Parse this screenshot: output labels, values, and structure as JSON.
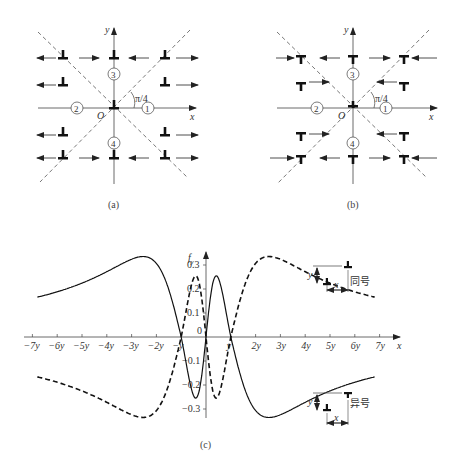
{
  "panels": {
    "a": {
      "caption": "(a)",
      "axis_x": "x",
      "axis_y": "y",
      "origin": "O",
      "angle": "π/4",
      "regions": [
        "①",
        "②",
        "③",
        "④"
      ],
      "dislocation_symbol": "⊥",
      "arrows": "outward (pointing away from y-axis, left and right)"
    },
    "b": {
      "caption": "(b)",
      "axis_x": "x",
      "axis_y": "y",
      "origin": "O",
      "angle": "π/4",
      "regions": [
        "①",
        "②",
        "③",
        "④"
      ],
      "dislocation_symbol": "T",
      "arrows": "inward (pointing toward dislocations)"
    },
    "c": {
      "caption": "(c)",
      "y_label": "f",
      "y_label_sub": "y",
      "x_label": "x",
      "legend_same": "同号",
      "legend_opposite": "异号",
      "legend_y": "y",
      "legend_x": "x"
    }
  },
  "chart_data": {
    "type": "line",
    "title": "",
    "xlabel": "x",
    "ylabel": "f_y",
    "x_ticks": [
      "-7y",
      "-6y",
      "-5y",
      "-4y",
      "-3y",
      "-2y",
      "-y",
      "y",
      "2y",
      "3y",
      "4y",
      "5y",
      "6y",
      "7y"
    ],
    "y_ticks": [
      "-0.3",
      "-0.2",
      "-0.1",
      "0",
      "0.1",
      "0.2",
      "0.3"
    ],
    "xlim": [
      -7,
      7
    ],
    "ylim": [
      -0.35,
      0.35
    ],
    "grid": false,
    "series": [
      {
        "name": "同号 (same sign)",
        "style": "solid",
        "x": [
          -6.8,
          -5,
          -3.5,
          -2.5,
          -1.5,
          -1,
          -0.5,
          0,
          0.5,
          1,
          1.5,
          2,
          3,
          4,
          5,
          6,
          6.8
        ],
        "values": [
          -0.13,
          -0.17,
          -0.23,
          -0.26,
          -0.2,
          0,
          0.25,
          0,
          -0.25,
          0,
          0.15,
          0.24,
          0.26,
          0.21,
          0.17,
          0.14,
          0.12
        ]
      },
      {
        "name": "异号 (opposite sign)",
        "style": "dashed",
        "x": [
          -6.8,
          -6,
          -5,
          -4,
          -3,
          -2.5,
          -1.5,
          -1,
          -0.5,
          0,
          0.5,
          1,
          1.5,
          2,
          3,
          4,
          5,
          6,
          6.8
        ],
        "values": [
          0.13,
          0.14,
          0.17,
          0.22,
          0.26,
          0.26,
          0.2,
          0,
          -0.25,
          0,
          0.25,
          0,
          -0.15,
          -0.24,
          -0.26,
          -0.22,
          -0.17,
          -0.14,
          -0.12
        ]
      }
    ],
    "legend": [
      "同号",
      "异号"
    ],
    "legend_position": "inline right"
  }
}
